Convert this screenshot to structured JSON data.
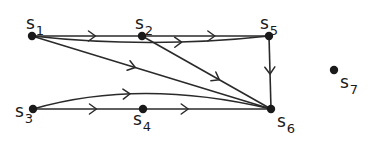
{
  "diagram": {
    "type": "directed-graph",
    "nodes": [
      {
        "id": "s1",
        "base": "s",
        "sub": "1"
      },
      {
        "id": "s2",
        "base": "s",
        "sub": "2"
      },
      {
        "id": "s3",
        "base": "s",
        "sub": "3"
      },
      {
        "id": "s4",
        "base": "s",
        "sub": "4"
      },
      {
        "id": "s5",
        "base": "s",
        "sub": "5"
      },
      {
        "id": "s6",
        "base": "s",
        "sub": "6"
      },
      {
        "id": "s7",
        "base": "s",
        "sub": "7"
      }
    ],
    "edges": [
      {
        "from": "s1",
        "to": "s2"
      },
      {
        "from": "s2",
        "to": "s5"
      },
      {
        "from": "s1",
        "to": "s5"
      },
      {
        "from": "s1",
        "to": "s6"
      },
      {
        "from": "s2",
        "to": "s6"
      },
      {
        "from": "s5",
        "to": "s6"
      },
      {
        "from": "s3",
        "to": "s4"
      },
      {
        "from": "s4",
        "to": "s6"
      },
      {
        "from": "s3",
        "to": "s6"
      }
    ],
    "colors": {
      "ink": "#1a1a1a",
      "background": "#ffffff"
    }
  }
}
